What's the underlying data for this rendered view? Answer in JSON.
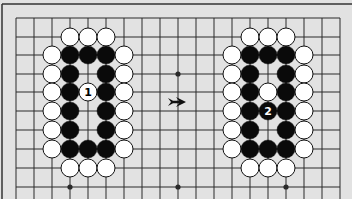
{
  "diagram": {
    "colors": {
      "board": "#e2e2e2",
      "line": "#2a2a2a",
      "frame": "#333333",
      "black_stone": "#0a0a0a",
      "white_stone": "#ffffff",
      "below": "#ffffff"
    },
    "grid": {
      "x0": 16,
      "dx": 18,
      "cols": 19,
      "rows_y": [
        18,
        37,
        55,
        74,
        92,
        111,
        130,
        149,
        168,
        187
      ]
    },
    "star_points": [
      {
        "col": 9,
        "row": 3
      },
      {
        "col": 3,
        "row": 9
      },
      {
        "col": 9,
        "row": 9
      },
      {
        "col": 15,
        "row": 9
      }
    ],
    "left_shape": {
      "label": "Before",
      "stones": [
        {
          "c": 3,
          "r": 1,
          "color": "white"
        },
        {
          "c": 4,
          "r": 1,
          "color": "white"
        },
        {
          "c": 5,
          "r": 1,
          "color": "white"
        },
        {
          "c": 2,
          "r": 2,
          "color": "white"
        },
        {
          "c": 3,
          "r": 2,
          "color": "black"
        },
        {
          "c": 4,
          "r": 2,
          "color": "black"
        },
        {
          "c": 5,
          "r": 2,
          "color": "black"
        },
        {
          "c": 6,
          "r": 2,
          "color": "white"
        },
        {
          "c": 2,
          "r": 3,
          "color": "white"
        },
        {
          "c": 3,
          "r": 3,
          "color": "black"
        },
        {
          "c": 5,
          "r": 3,
          "color": "black"
        },
        {
          "c": 6,
          "r": 3,
          "color": "white"
        },
        {
          "c": 2,
          "r": 4,
          "color": "white"
        },
        {
          "c": 3,
          "r": 4,
          "color": "black"
        },
        {
          "c": 4,
          "r": 4,
          "color": "white",
          "label": "1"
        },
        {
          "c": 5,
          "r": 4,
          "color": "black"
        },
        {
          "c": 6,
          "r": 4,
          "color": "white"
        },
        {
          "c": 2,
          "r": 5,
          "color": "white"
        },
        {
          "c": 3,
          "r": 5,
          "color": "black"
        },
        {
          "c": 5,
          "r": 5,
          "color": "black"
        },
        {
          "c": 6,
          "r": 5,
          "color": "white"
        },
        {
          "c": 2,
          "r": 6,
          "color": "white"
        },
        {
          "c": 3,
          "r": 6,
          "color": "black"
        },
        {
          "c": 5,
          "r": 6,
          "color": "black"
        },
        {
          "c": 6,
          "r": 6,
          "color": "white"
        },
        {
          "c": 2,
          "r": 7,
          "color": "white"
        },
        {
          "c": 3,
          "r": 7,
          "color": "black"
        },
        {
          "c": 4,
          "r": 7,
          "color": "black"
        },
        {
          "c": 5,
          "r": 7,
          "color": "black"
        },
        {
          "c": 6,
          "r": 7,
          "color": "white"
        },
        {
          "c": 3,
          "r": 8,
          "color": "white"
        },
        {
          "c": 4,
          "r": 8,
          "color": "white"
        },
        {
          "c": 5,
          "r": 8,
          "color": "white"
        }
      ]
    },
    "right_shape": {
      "label": "After",
      "stones": [
        {
          "c": 13,
          "r": 1,
          "color": "white"
        },
        {
          "c": 14,
          "r": 1,
          "color": "white"
        },
        {
          "c": 15,
          "r": 1,
          "color": "white"
        },
        {
          "c": 12,
          "r": 2,
          "color": "white"
        },
        {
          "c": 13,
          "r": 2,
          "color": "black"
        },
        {
          "c": 14,
          "r": 2,
          "color": "black"
        },
        {
          "c": 15,
          "r": 2,
          "color": "black"
        },
        {
          "c": 16,
          "r": 2,
          "color": "white"
        },
        {
          "c": 12,
          "r": 3,
          "color": "white"
        },
        {
          "c": 13,
          "r": 3,
          "color": "black"
        },
        {
          "c": 15,
          "r": 3,
          "color": "black"
        },
        {
          "c": 16,
          "r": 3,
          "color": "white"
        },
        {
          "c": 12,
          "r": 4,
          "color": "white"
        },
        {
          "c": 13,
          "r": 4,
          "color": "black"
        },
        {
          "c": 14,
          "r": 4,
          "color": "white"
        },
        {
          "c": 15,
          "r": 4,
          "color": "black"
        },
        {
          "c": 16,
          "r": 4,
          "color": "white"
        },
        {
          "c": 12,
          "r": 5,
          "color": "white"
        },
        {
          "c": 13,
          "r": 5,
          "color": "black"
        },
        {
          "c": 14,
          "r": 5,
          "color": "black",
          "label": "2"
        },
        {
          "c": 15,
          "r": 5,
          "color": "black"
        },
        {
          "c": 16,
          "r": 5,
          "color": "white"
        },
        {
          "c": 12,
          "r": 6,
          "color": "white"
        },
        {
          "c": 13,
          "r": 6,
          "color": "black"
        },
        {
          "c": 15,
          "r": 6,
          "color": "black"
        },
        {
          "c": 16,
          "r": 6,
          "color": "white"
        },
        {
          "c": 12,
          "r": 7,
          "color": "white"
        },
        {
          "c": 13,
          "r": 7,
          "color": "black"
        },
        {
          "c": 14,
          "r": 7,
          "color": "black"
        },
        {
          "c": 15,
          "r": 7,
          "color": "black"
        },
        {
          "c": 16,
          "r": 7,
          "color": "white"
        },
        {
          "c": 13,
          "r": 8,
          "color": "white"
        },
        {
          "c": 14,
          "r": 8,
          "color": "white"
        },
        {
          "c": 15,
          "r": 8,
          "color": "white"
        }
      ]
    },
    "arrow": {
      "symbol": "right-arrow",
      "x": 177,
      "y": 102
    }
  }
}
